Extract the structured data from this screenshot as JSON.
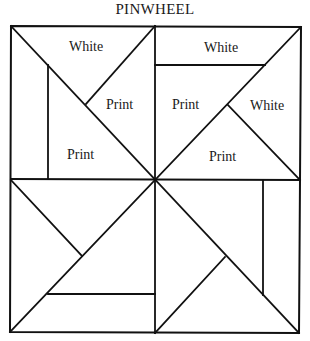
{
  "title": "PINWHEEL",
  "labels": {
    "tl_top": "White",
    "tl_right": "Print",
    "tl_bottom": "Print",
    "tr_top": "White",
    "tr_left": "Print",
    "tr_right": "White",
    "tr_bottom": "Print"
  },
  "colors": {
    "line": "#111111",
    "background": "#ffffff",
    "text": "#1a1a1a"
  }
}
